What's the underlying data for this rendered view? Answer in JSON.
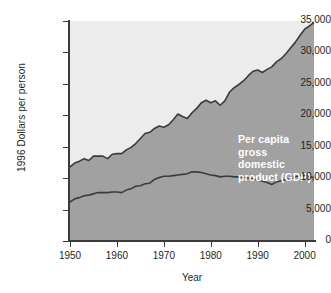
{
  "chart_data": {
    "type": "area",
    "title": "",
    "xlabel": "Year",
    "ylabel": "1996 Dollars per person",
    "xlim": [
      1950,
      2002
    ],
    "ylim": [
      0,
      35000
    ],
    "grid": false,
    "legend_position": "in-plot-annotations",
    "ytick_labels": [
      "35,000",
      "30,000",
      "25,000",
      "20,000",
      "15,000",
      "10,000",
      "5,000",
      "0"
    ],
    "ytick_values": [
      35000,
      30000,
      25000,
      20000,
      15000,
      10000,
      5000,
      0
    ],
    "xtick_labels": [
      "1950",
      "1960",
      "1970",
      "1980",
      "1990",
      "2000"
    ],
    "xtick_values": [
      1950,
      1960,
      1970,
      1980,
      1990,
      2000
    ],
    "colors": {
      "upper_background": "#ececec",
      "area_fill": "#a1a1a1",
      "line": "#3b3b3b",
      "annotation_text": "#ffffff",
      "axis_text": "#231f20"
    },
    "annotations": [
      {
        "name": "gdp-annotation",
        "text": "Per capita gross\ndomestic product (GDP)"
      },
      {
        "name": "gpi-annotation",
        "text": "Per capita genuine progress indicator (GPI)"
      }
    ],
    "x": [
      1950,
      1951,
      1952,
      1953,
      1954,
      1955,
      1956,
      1957,
      1958,
      1959,
      1960,
      1961,
      1962,
      1963,
      1964,
      1965,
      1966,
      1967,
      1968,
      1969,
      1970,
      1971,
      1972,
      1973,
      1974,
      1975,
      1976,
      1977,
      1978,
      1979,
      1980,
      1981,
      1982,
      1983,
      1984,
      1985,
      1986,
      1987,
      1988,
      1989,
      1990,
      1991,
      1992,
      1993,
      1994,
      1995,
      1996,
      1997,
      1998,
      1999,
      2000,
      2001,
      2002
    ],
    "series": [
      {
        "name": "Per capita gross domestic product (GDP)",
        "values": [
          11800,
          12400,
          12700,
          13100,
          12800,
          13500,
          13500,
          13500,
          13100,
          13800,
          13900,
          13900,
          14500,
          14900,
          15500,
          16300,
          17100,
          17300,
          17900,
          18300,
          18100,
          18500,
          19300,
          20200,
          19800,
          19500,
          20400,
          21100,
          22000,
          22400,
          22000,
          22300,
          21600,
          22300,
          23700,
          24400,
          24900,
          25500,
          26300,
          27000,
          27200,
          26800,
          27300,
          27700,
          28500,
          29000,
          29800,
          30700,
          31600,
          32700,
          33700,
          34200,
          34800
        ]
      },
      {
        "name": "Per capita genuine progress indicator (GPI)",
        "values": [
          6200,
          6700,
          6900,
          7200,
          7300,
          7500,
          7700,
          7700,
          7700,
          7800,
          7800,
          7700,
          8100,
          8300,
          8700,
          8800,
          9100,
          9200,
          9800,
          10100,
          10300,
          10300,
          10400,
          10500,
          10600,
          10700,
          11000,
          11000,
          10900,
          10700,
          10500,
          10400,
          10200,
          10300,
          10300,
          10200,
          10200,
          10100,
          10000,
          9900,
          9700,
          9500,
          9300,
          9000,
          9400,
          9600,
          9800,
          9900,
          10200,
          10400,
          10600,
          10200,
          10100
        ]
      }
    ]
  }
}
